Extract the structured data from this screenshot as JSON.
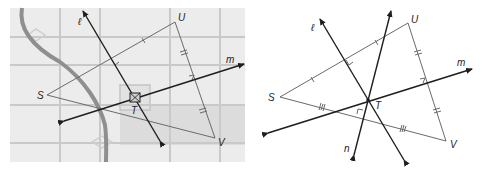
{
  "left_figure": {
    "description": "Map with grid streets, a curving road, and triangle SUV with perpendicular bisectors",
    "vertices": {
      "S": "S",
      "U": "U",
      "V": "V"
    },
    "point_T": "T",
    "lines": {
      "l": "ℓ",
      "m": "m"
    },
    "colors": {
      "background": "#e8e8e8",
      "grid": "#c8c8c8",
      "road": "#8c8c8c",
      "shaded_block": "#d9d9d9",
      "line": "#1e1e1e",
      "triangle": "#6a6a6a"
    }
  },
  "right_figure": {
    "description": "Triangle SUV with three perpendicular bisectors concurrent at T",
    "vertices": {
      "S": "S",
      "U": "U",
      "V": "V"
    },
    "point_T": "T",
    "lines": {
      "l": "ℓ",
      "m": "m",
      "n": "n"
    }
  }
}
